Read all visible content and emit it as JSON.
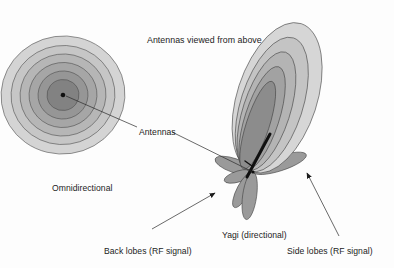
{
  "figure": {
    "title": "Antennas viewed from above",
    "background_color": "#fdfdfd",
    "labels": {
      "omnidirectional": "Omnidirectional",
      "antennas": "Antennas",
      "yagi": "Yagi (directional)",
      "back_lobes": "Back lobes (RF signal)",
      "side_lobes": "Side lobes (RF signal)"
    },
    "palette": {
      "ring_1_outer": "#d4d4d4",
      "ring_2": "#c2c2c2",
      "ring_3": "#b0b0b0",
      "ring_4": "#9e9e9e",
      "ring_5": "#8c8c8c",
      "ring_6_inner": "#7a7a7a",
      "lobe_1_outer": "#d6d6d6",
      "lobe_2": "#c4c4c4",
      "lobe_3": "#b2b2b2",
      "lobe_4": "#9d9d9d",
      "lobe_5_inner": "#8a8a8a",
      "side_lobe_fill": "#9a9a9a",
      "antenna_element": "#111111",
      "outline": "#4a4a4a",
      "text": "#1c1c1c",
      "leader": "#2a2a2a"
    },
    "omnidirectional_pattern": {
      "center": {
        "x": 63,
        "y": 95
      },
      "radii": [
        62,
        52,
        43,
        34,
        25,
        16
      ],
      "ring_count": 6,
      "center_dot_radius": 2.2
    },
    "yagi_pattern": {
      "origin": {
        "x": 253,
        "y": 172
      },
      "main_lobe_count": 5,
      "main_lobe_direction_deg": 20,
      "side_lobes": [
        {
          "name": "upper-left-lobe",
          "angle_deg": -118,
          "length": 46,
          "width": 13
        },
        {
          "name": "left-back-lobe",
          "angle_deg": -166,
          "length": 40,
          "width": 10
        },
        {
          "name": "lower-left-lobe",
          "angle_deg": 158,
          "length": 30,
          "width": 9
        },
        {
          "name": "lower-lobe",
          "angle_deg": 108,
          "length": 44,
          "width": 11
        },
        {
          "name": "right-side-lobe",
          "angle_deg": -22,
          "length": 52,
          "width": 12
        }
      ],
      "antenna_element": {
        "x1": 246,
        "y1": 176,
        "x2": 270,
        "y2": 134
      }
    },
    "leaders": [
      {
        "name": "antennas-to-omni",
        "from": [
          137,
          126
        ],
        "to": [
          65,
          96
        ],
        "arrow": false
      },
      {
        "name": "antennas-to-yagi",
        "from": [
          170,
          131
        ],
        "to": [
          252,
          171
        ],
        "arrow": false
      },
      {
        "name": "back-lobes-to-lobe",
        "from": [
          152,
          230
        ],
        "to": [
          216,
          193
        ],
        "arrow": true
      },
      {
        "name": "side-lobes-to-lobe",
        "from": [
          339,
          237
        ],
        "to": [
          306,
          172
        ],
        "arrow": true
      }
    ]
  }
}
